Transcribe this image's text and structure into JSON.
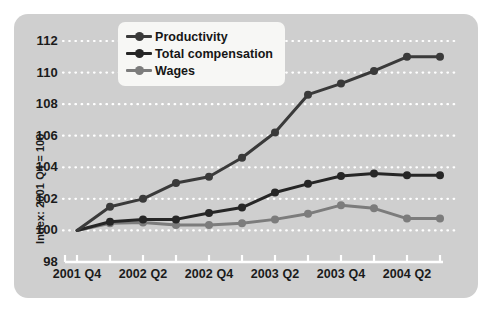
{
  "chart_data": {
    "type": "line",
    "title": "",
    "xlabel": "",
    "ylabel": "Index: 2001 Q4 = 100",
    "ylim": [
      98,
      112.6
    ],
    "yticks": [
      98,
      100,
      102,
      104,
      106,
      108,
      110,
      112
    ],
    "grid": true,
    "grid_style": "white dotted horizontal",
    "legend_position": "top-center-left",
    "x": [
      "2001 Q4",
      "2002 Q1",
      "2002 Q2",
      "2002 Q3",
      "2002 Q4",
      "2003 Q1",
      "2003 Q2",
      "2003 Q3",
      "2003 Q4",
      "2004 Q1",
      "2004 Q2",
      "2004 Q3"
    ],
    "xtick_labels": [
      "2001 Q4",
      "2002 Q2",
      "2002 Q4",
      "2003 Q2",
      "2003 Q4",
      "2004 Q2"
    ],
    "xtick_label_indices": [
      0,
      2,
      4,
      6,
      8,
      10
    ],
    "series": [
      {
        "name": "Productivity",
        "color": "#3a3a3a",
        "values": [
          100.0,
          101.5,
          102.0,
          103.0,
          103.4,
          104.6,
          106.2,
          108.6,
          109.3,
          110.1,
          111.0,
          111.0
        ]
      },
      {
        "name": "Total compensation",
        "color": "#262626",
        "values": [
          100.0,
          100.55,
          100.7,
          100.7,
          101.1,
          101.45,
          102.4,
          102.95,
          103.45,
          103.6,
          103.5,
          103.5
        ]
      },
      {
        "name": "Wages",
        "color": "#7c7c7c",
        "values": [
          100.0,
          100.45,
          100.5,
          100.35,
          100.35,
          100.45,
          100.7,
          101.05,
          101.6,
          101.4,
          100.75,
          100.75
        ]
      }
    ]
  },
  "legend": {
    "items": [
      {
        "label": "Productivity",
        "color": "#3a3a3a"
      },
      {
        "label": "Total compensation",
        "color": "#262626"
      },
      {
        "label": "Wages",
        "color": "#7c7c7c"
      }
    ]
  },
  "axis": {
    "y_title": "Index: 2001 Q4 = 100",
    "y_tick_labels": [
      "112",
      "110",
      "108",
      "106",
      "104",
      "102",
      "100",
      "98"
    ],
    "x_tick_labels": [
      "2001 Q4",
      "2002 Q2",
      "2002 Q4",
      "2003 Q2",
      "2003 Q4",
      "2004 Q2"
    ]
  },
  "colors": {
    "panel_background": "#cfcfcf",
    "page_background": "#ffffff",
    "grid": "#ffffff",
    "axis_line": "#ffffff",
    "text": "#1b1b1b",
    "legend_background": "#f7f7f5"
  }
}
